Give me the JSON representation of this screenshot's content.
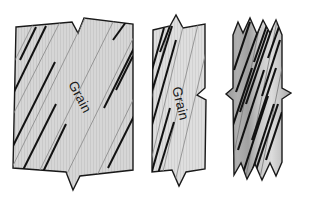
{
  "figure": {
    "name": "wood-grain-fracture-specimens",
    "background_color": "#ffffff",
    "width": 309,
    "height": 199,
    "specimen_count": 3
  },
  "labels": {
    "grain_1": "Grain",
    "grain_2": "Grain",
    "grain_3": ""
  },
  "colors": {
    "outline": "#1a1a1a",
    "fill_light": "#d4d4d4",
    "fill_light_2": "#dcdcdc",
    "fill_mid": "#c4c4c4",
    "fill_dark": "#a8a8a8",
    "fill_dark_2": "#9a9a9a",
    "grain_line_thin": "#8a8a8a",
    "crack_line": "#111111",
    "texture_line": "#bdbdbd"
  },
  "specimens": [
    {
      "id": "specimen-1",
      "name": "wide-board-shallow-grain",
      "grain_label": "Grain",
      "grain_angle_deg": 62,
      "label_rotation_deg": 62,
      "break_type": "v-notch-top-and-bottom",
      "fill": "#d4d4d4"
    },
    {
      "id": "specimen-2",
      "name": "narrow-board-steep-grain",
      "grain_label": "Grain",
      "grain_angle_deg": 75,
      "label_rotation_deg": 75,
      "break_type": "v-notch-top-bottom-and-side-zigzag",
      "fill": "#dcdcdc"
    },
    {
      "id": "specimen-3",
      "name": "narrow-board-splintered-break",
      "grain_label": "",
      "grain_angle_deg": 78,
      "label_rotation_deg": 0,
      "break_type": "splintered-zigzag-top-and-bottom",
      "fill": "#a8a8a8"
    }
  ]
}
